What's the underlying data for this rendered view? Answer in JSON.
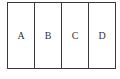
{
  "diagram": {
    "cells": [
      {
        "label": "A"
      },
      {
        "label": "B"
      },
      {
        "label": "C"
      },
      {
        "label": "D"
      }
    ],
    "border_color": "#3a3a3a",
    "text_color": "#333333"
  }
}
